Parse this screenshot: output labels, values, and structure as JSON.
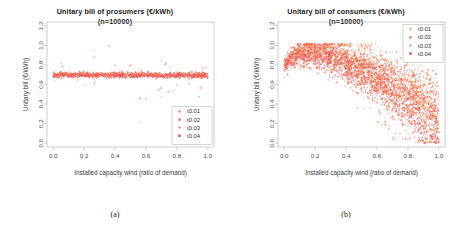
{
  "figure": {
    "panels": [
      {
        "caption": "(a)",
        "title_line1": "Unitary bill of prosumers (€/kWh)",
        "title_line2": "(n=10000)",
        "legend_position": "bottom-right"
      },
      {
        "caption": "(b)",
        "title_line1": "Unitary bill of consumers (€/kWh)",
        "title_line2": "(n=10000)",
        "legend_position": "top-right"
      }
    ]
  },
  "chart_data": [
    {
      "type": "scatter",
      "title": "Unitary bill of prosumers (€/kWh)",
      "subtitle": "(n=10000)",
      "xlabel": "Installed capacity wind (ratio of demand)",
      "ylabel": "Unitary bill (€/kWh)",
      "xlim": [
        -0.04,
        1.04
      ],
      "ylim": [
        -0.04,
        1.24
      ],
      "xticks": [
        0.0,
        0.2,
        0.4,
        0.6,
        0.8,
        1.0
      ],
      "xticklabels": [
        "0.0",
        "0.2",
        "0.4",
        "0.6",
        "0.8",
        "1.0"
      ],
      "yticks": [
        0.0,
        0.2,
        0.4,
        0.6,
        0.8,
        1.0,
        1.2
      ],
      "yticklabels": [
        "0.0",
        "0.2",
        "0.4",
        "0.6",
        "0.8",
        "1.0",
        "1.2"
      ],
      "grid": false,
      "legend": [
        "t0.01",
        "t0.02",
        "t0.03",
        "t0.04"
      ],
      "legend_markers": [
        "dot",
        "dot",
        "plus",
        "dot"
      ],
      "series": [
        {
          "name": "t0.01",
          "color": "#f4a07a",
          "marker": "dot",
          "band": {
            "center": 0.703,
            "spread": 0.012,
            "slope": -0.004,
            "n": 320
          }
        },
        {
          "name": "t0.02",
          "color": "#f2855f",
          "marker": "dot",
          "band": {
            "center": 0.7,
            "spread": 0.013,
            "slope": -0.004,
            "n": 320
          }
        },
        {
          "name": "t0.03",
          "color": "#ef6a4a",
          "marker": "plus",
          "band": {
            "center": 0.698,
            "spread": 0.014,
            "slope": -0.004,
            "n": 300
          }
        },
        {
          "name": "t0.04",
          "color": "#e8536b",
          "marker": "dot",
          "band": {
            "center": 0.696,
            "spread": 0.013,
            "slope": -0.004,
            "n": 300
          }
        }
      ],
      "outliers_above": [
        {
          "x": 0.01,
          "y": 0.635
        },
        {
          "x": 0.05,
          "y": 0.815
        },
        {
          "x": 0.06,
          "y": 0.785
        },
        {
          "x": 0.155,
          "y": 0.645
        },
        {
          "x": 0.26,
          "y": 0.955
        },
        {
          "x": 0.265,
          "y": 0.885
        },
        {
          "x": 0.27,
          "y": 0.625
        },
        {
          "x": 0.36,
          "y": 0.995
        },
        {
          "x": 0.4,
          "y": 0.795
        },
        {
          "x": 0.43,
          "y": 0.745
        },
        {
          "x": 0.445,
          "y": 0.735
        },
        {
          "x": 0.5,
          "y": 0.795
        },
        {
          "x": 0.555,
          "y": 0.755
        },
        {
          "x": 0.7,
          "y": 0.845
        },
        {
          "x": 0.725,
          "y": 0.805
        },
        {
          "x": 0.73,
          "y": 0.825
        },
        {
          "x": 0.755,
          "y": 0.775
        },
        {
          "x": 0.875,
          "y": 0.655
        },
        {
          "x": 0.92,
          "y": 0.735
        },
        {
          "x": 0.965,
          "y": 0.765
        },
        {
          "x": 0.985,
          "y": 0.775
        }
      ],
      "outliers_below": [
        {
          "x": 0.205,
          "y": 0.595
        },
        {
          "x": 0.265,
          "y": 0.605
        },
        {
          "x": 0.56,
          "y": 0.455
        },
        {
          "x": 0.565,
          "y": 0.215
        },
        {
          "x": 0.6,
          "y": 0.455
        },
        {
          "x": 0.685,
          "y": 0.545
        },
        {
          "x": 0.695,
          "y": 0.565
        },
        {
          "x": 0.7,
          "y": 0.475
        },
        {
          "x": 0.745,
          "y": 0.525
        },
        {
          "x": 0.775,
          "y": 0.535
        },
        {
          "x": 0.8,
          "y": 0.595
        },
        {
          "x": 0.875,
          "y": 0.615
        },
        {
          "x": 0.885,
          "y": 0.605
        },
        {
          "x": 0.945,
          "y": 0.475
        },
        {
          "x": 0.955,
          "y": 0.565
        }
      ]
    },
    {
      "type": "scatter",
      "title": "Unitary bill of consumers (€/kWh)",
      "subtitle": "(n=10000)",
      "xlabel": "Installed capacity wind (ratio of demand)",
      "ylabel": "Unitary bill (€/kWh)",
      "xlim": [
        -0.04,
        1.04
      ],
      "ylim": [
        -0.04,
        1.24
      ],
      "xticks": [
        0.0,
        0.2,
        0.4,
        0.6,
        0.8,
        1.0
      ],
      "xticklabels": [
        "0.0",
        "0.2",
        "0.4",
        "0.6",
        "0.8",
        "1.0"
      ],
      "yticks": [
        0.0,
        0.2,
        0.4,
        0.6,
        0.8,
        1.0,
        1.2
      ],
      "yticklabels": [
        "0.0",
        "0.2",
        "0.4",
        "0.6",
        "0.8",
        "1.0",
        "1.2"
      ],
      "grid": false,
      "legend": [
        "t0.01",
        "t0.02",
        "t0.03",
        "t0.04"
      ],
      "legend_markers": [
        "dot",
        "dot",
        "plus",
        "dot"
      ],
      "envelope_note": "Cloud rises from ~0.80 at x=0 to a ridge near 0.95 at x=0.15, then falls and fans out, spanning ~0.0 to ~0.55 at x=1.0",
      "series": [
        {
          "name": "t0.01",
          "color": "#f6b48c",
          "marker": "dot",
          "offset": 0.045,
          "n": 900
        },
        {
          "name": "t0.02",
          "color": "#f59060",
          "marker": "dot",
          "offset": 0.015,
          "n": 950
        },
        {
          "name": "t0.03",
          "color": "#f2713f",
          "marker": "plus",
          "offset": -0.02,
          "n": 900
        },
        {
          "name": "t0.04",
          "color": "#e8527a",
          "marker": "dot",
          "offset": -0.055,
          "n": 950
        }
      ],
      "curve_points": [
        {
          "x": 0.0,
          "y": 0.8
        },
        {
          "x": 0.05,
          "y": 0.885
        },
        {
          "x": 0.1,
          "y": 0.925
        },
        {
          "x": 0.15,
          "y": 0.945
        },
        {
          "x": 0.2,
          "y": 0.94
        },
        {
          "x": 0.3,
          "y": 0.9
        },
        {
          "x": 0.4,
          "y": 0.84
        },
        {
          "x": 0.5,
          "y": 0.77
        },
        {
          "x": 0.6,
          "y": 0.68
        },
        {
          "x": 0.7,
          "y": 0.585
        },
        {
          "x": 0.8,
          "y": 0.48
        },
        {
          "x": 0.9,
          "y": 0.365
        },
        {
          "x": 1.0,
          "y": 0.26
        }
      ],
      "spread_points": [
        {
          "x": 0.0,
          "spread": 0.035
        },
        {
          "x": 0.1,
          "spread": 0.065
        },
        {
          "x": 0.2,
          "spread": 0.075
        },
        {
          "x": 0.4,
          "spread": 0.105
        },
        {
          "x": 0.6,
          "spread": 0.14
        },
        {
          "x": 0.8,
          "spread": 0.175
        },
        {
          "x": 1.0,
          "spread": 0.215
        }
      ]
    }
  ]
}
